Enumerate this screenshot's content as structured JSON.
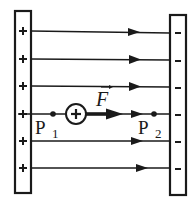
{
  "diagram": {
    "left_plate": {
      "sign": "+",
      "charges": [
        "+",
        "+",
        "+",
        "+",
        "+",
        "+"
      ]
    },
    "right_plate": {
      "sign": "-",
      "charges": [
        "-",
        "-",
        "-",
        "-",
        "-",
        "-"
      ]
    },
    "field_lines": {
      "count": 6,
      "direction": "left-to-right"
    },
    "charge": {
      "symbol": "+",
      "label": "positive test charge"
    },
    "force": {
      "label": "F",
      "vector_mark": "→"
    },
    "points": [
      {
        "label": "P",
        "subscript": "1"
      },
      {
        "label": "P",
        "subscript": "2"
      }
    ]
  },
  "colors": {
    "ink": "#1a1a1a",
    "background": "#ffffff"
  }
}
